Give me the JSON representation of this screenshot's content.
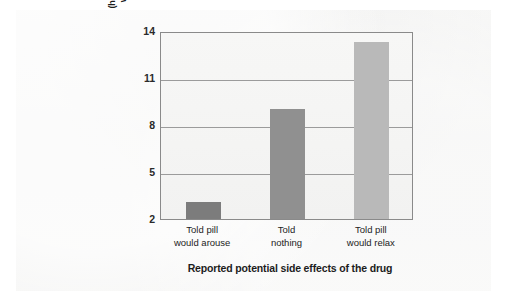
{
  "chart_data": {
    "type": "bar",
    "title": "",
    "categories": [
      "Told pill would arouse",
      "Told nothing",
      "Told pill would relax"
    ],
    "category_lines": [
      [
        "Told pill",
        "would arouse"
      ],
      [
        "Told",
        "nothing"
      ],
      [
        "Told pill",
        "would relax"
      ]
    ],
    "values": [
      3.1,
      9.0,
      13.3
    ],
    "xlabel": "Reported potential side effects of the drug",
    "ylabel": "Mean subject opinion (higher score means more agreement with the attitude-discrepant essay)",
    "ylabel_lines": [
      "Mean subject opinion",
      "(higher score means more agreement",
      "with the attitude-discrepant essay)"
    ],
    "yticks": [
      14,
      11,
      8,
      5,
      2
    ],
    "ytick_labels": [
      "14",
      "11",
      "8",
      "5",
      "2"
    ],
    "ylim": [
      2,
      14
    ],
    "grid": true,
    "legend": "none",
    "bar_colors": [
      "#7c7c7c",
      "#909090",
      "#b9b9b9"
    ],
    "axis_color": "#8a8a8a",
    "gridline_color": "#9b9b9b",
    "background_color": "#f2f2f1"
  }
}
